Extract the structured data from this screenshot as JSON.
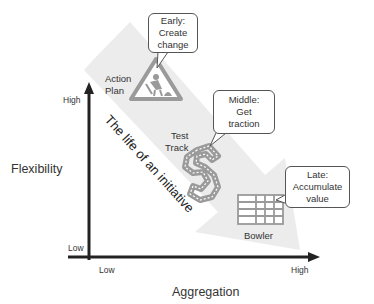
{
  "diagram": {
    "arrow_label": "The life of an initiative",
    "axes": {
      "y": {
        "title": "Flexibility",
        "high": "High",
        "low": "Low"
      },
      "x": {
        "title": "Aggregation",
        "high": "High",
        "low": "Low"
      }
    },
    "stages": [
      {
        "name": "Action Plan",
        "name_lines": [
          "Action",
          "Plan"
        ],
        "icon": "under-construction-sign-icon",
        "callout": [
          "Early:",
          "Create",
          "change"
        ]
      },
      {
        "name": "Test Track",
        "name_lines": [
          "Test",
          "Track"
        ],
        "icon": "race-track-icon",
        "callout": [
          "Middle:",
          "Get",
          "traction"
        ]
      },
      {
        "name": "Bowler",
        "name_lines": [
          "Bowler"
        ],
        "icon": "grid-table-icon",
        "callout": [
          "Late:",
          "Accumulate",
          "value"
        ]
      }
    ],
    "colors": {
      "arrow_fill": "#ececec",
      "icon_stroke": "#9a9a9a",
      "axis": "#222222",
      "callout_border": "#555555"
    }
  }
}
